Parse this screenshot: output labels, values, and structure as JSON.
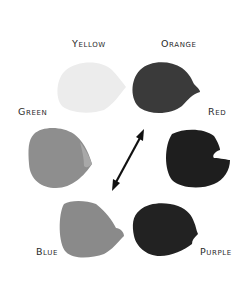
{
  "labels": {
    "yellow": "Yellow",
    "orange": "Orange",
    "green": "Green",
    "red": "Red",
    "blue": "Blue",
    "purple": "Purple"
  },
  "swatches": [
    {
      "name": "yellow",
      "fill": "#ececec"
    },
    {
      "name": "orange",
      "fill": "#3a3a3a"
    },
    {
      "name": "green",
      "fill": "#8e8e8e"
    },
    {
      "name": "red",
      "fill": "#1e1e1e"
    },
    {
      "name": "blue",
      "fill": "#8a8a8a"
    },
    {
      "name": "purple",
      "fill": "#222222"
    }
  ],
  "arrow": {
    "from": [
      144,
      130
    ],
    "to": [
      112,
      190
    ],
    "style": "double-headed",
    "color": "#111111"
  }
}
